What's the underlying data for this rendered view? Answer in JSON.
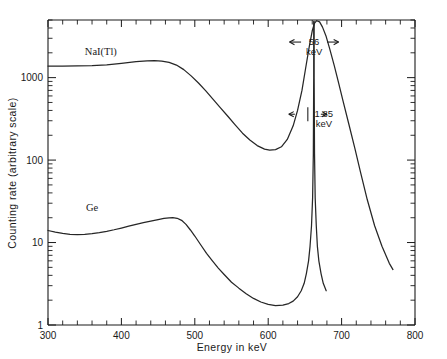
{
  "figure": {
    "background": "#ffffff",
    "ink_color": "#262626"
  },
  "chart_data": {
    "type": "line",
    "title": "",
    "xlabel": "Energy in keV",
    "ylabel": "Counting rate (arbitrary scale)",
    "xlim": [
      300,
      800
    ],
    "ylim": [
      1,
      5000
    ],
    "yscale": "log",
    "xscale": "linear",
    "grid": false,
    "legend": "inline-labels",
    "x_ticks": [
      300,
      400,
      500,
      600,
      700,
      800
    ],
    "x_tick_labels": [
      "300",
      "400",
      "500",
      "600",
      "700",
      "800"
    ],
    "x_minor_tick_step": 20,
    "y_ticks": [
      1,
      10,
      100,
      1000
    ],
    "y_tick_labels": [
      "1",
      "10",
      "100",
      "1000"
    ],
    "y_minor_decades": [
      1,
      10,
      100,
      1000
    ],
    "series": [
      {
        "name": "NaI(Tl)",
        "label_x": 372,
        "label_y": 1900,
        "points": [
          [
            300,
            1380
          ],
          [
            320,
            1380
          ],
          [
            340,
            1385
          ],
          [
            360,
            1400
          ],
          [
            380,
            1430
          ],
          [
            400,
            1490
          ],
          [
            420,
            1560
          ],
          [
            435,
            1600
          ],
          [
            445,
            1610
          ],
          [
            455,
            1590
          ],
          [
            465,
            1530
          ],
          [
            475,
            1420
          ],
          [
            485,
            1250
          ],
          [
            495,
            1050
          ],
          [
            505,
            860
          ],
          [
            515,
            690
          ],
          [
            525,
            545
          ],
          [
            535,
            430
          ],
          [
            545,
            340
          ],
          [
            555,
            268
          ],
          [
            565,
            212
          ],
          [
            575,
            175
          ],
          [
            585,
            150
          ],
          [
            595,
            136
          ],
          [
            602,
            132
          ],
          [
            610,
            134
          ],
          [
            618,
            145
          ],
          [
            626,
            178
          ],
          [
            634,
            260
          ],
          [
            640,
            400
          ],
          [
            646,
            700
          ],
          [
            651,
            1300
          ],
          [
            656,
            2400
          ],
          [
            660,
            3700
          ],
          [
            663,
            4550
          ],
          [
            666,
            4900
          ],
          [
            670,
            4750
          ],
          [
            674,
            4100
          ],
          [
            679,
            3150
          ],
          [
            684,
            2200
          ],
          [
            690,
            1400
          ],
          [
            696,
            860
          ],
          [
            702,
            520
          ],
          [
            710,
            270
          ],
          [
            718,
            140
          ],
          [
            726,
            70
          ],
          [
            735,
            33
          ],
          [
            745,
            16
          ],
          [
            755,
            9
          ],
          [
            765,
            5.6
          ],
          [
            770,
            4.7
          ]
        ]
      },
      {
        "name": "Ge",
        "label_x": 360,
        "label_y": 24,
        "points": [
          [
            300,
            14.0
          ],
          [
            310,
            13.4
          ],
          [
            320,
            12.9
          ],
          [
            330,
            12.6
          ],
          [
            340,
            12.5
          ],
          [
            350,
            12.6
          ],
          [
            360,
            12.8
          ],
          [
            370,
            13.2
          ],
          [
            380,
            13.7
          ],
          [
            390,
            14.3
          ],
          [
            400,
            15.0
          ],
          [
            410,
            15.8
          ],
          [
            420,
            16.6
          ],
          [
            430,
            17.4
          ],
          [
            440,
            18.2
          ],
          [
            450,
            19.0
          ],
          [
            458,
            19.6
          ],
          [
            465,
            19.9
          ],
          [
            470,
            20.0
          ],
          [
            476,
            19.7
          ],
          [
            482,
            18.6
          ],
          [
            488,
            16.6
          ],
          [
            494,
            14.2
          ],
          [
            500,
            12.0
          ],
          [
            508,
            9.4
          ],
          [
            516,
            7.4
          ],
          [
            524,
            6.0
          ],
          [
            532,
            4.9
          ],
          [
            540,
            4.1
          ],
          [
            550,
            3.3
          ],
          [
            560,
            2.8
          ],
          [
            570,
            2.4
          ],
          [
            580,
            2.1
          ],
          [
            590,
            1.9
          ],
          [
            600,
            1.78
          ],
          [
            610,
            1.72
          ],
          [
            620,
            1.74
          ],
          [
            628,
            1.82
          ],
          [
            634,
            1.95
          ],
          [
            640,
            2.2
          ],
          [
            645,
            2.6
          ],
          [
            649,
            3.2
          ],
          [
            652,
            4.2
          ],
          [
            655,
            6.0
          ],
          [
            657,
            9.0
          ],
          [
            659,
            16
          ],
          [
            660.5,
            35
          ],
          [
            661.5,
            120
          ],
          [
            662,
            1000
          ],
          [
            662,
            4800
          ],
          [
            662.6,
            4800
          ],
          [
            662.6,
            1000
          ],
          [
            663.1,
            120
          ],
          [
            664,
            35
          ],
          [
            665.5,
            16
          ],
          [
            667,
            9.0
          ],
          [
            669,
            6.0
          ],
          [
            672,
            4.2
          ],
          [
            675,
            3.2
          ],
          [
            679,
            2.6
          ]
        ]
      }
    ],
    "annotations": [
      {
        "id": "nai-fwhm",
        "text_line1": "56",
        "text_line2": "keV",
        "arrow_left_x": 629,
        "arrow_right_x": 696,
        "arrow_y": 2700,
        "kind": "double-arrow-horizontal"
      },
      {
        "id": "ge-fwhm",
        "text_line1": "1.85",
        "text_line2": "keV",
        "arrow_left_x": 628,
        "arrow_right_x": 680,
        "arrow_y": 360,
        "kind": "double-arrow-horizontal"
      }
    ]
  }
}
